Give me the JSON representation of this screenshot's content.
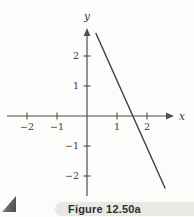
{
  "figure": {
    "caption": "Figure 12.50a"
  },
  "chart_data": {
    "type": "line",
    "title": "",
    "xlabel": "x",
    "ylabel": "y",
    "xlim": [
      -2.7,
      2.9
    ],
    "ylim": [
      -2.7,
      2.9
    ],
    "grid": false,
    "x_ticks": [
      -2,
      -1,
      1,
      2
    ],
    "x_tick_labels": [
      "−2",
      "−1",
      "1",
      "2"
    ],
    "y_ticks": [
      -2,
      -1,
      1,
      2
    ],
    "y_tick_labels": [
      "−2",
      "−1",
      "1",
      "2"
    ],
    "series": [
      {
        "name": "line-segment",
        "points": [
          [
            0.3,
            2.75
          ],
          [
            2.6,
            -2.4
          ]
        ],
        "x_intercept": 1.5,
        "approx_equation": "y = -2x + 3"
      }
    ],
    "legend": null
  },
  "colors": {
    "background": "#fcfcfa",
    "axis": "#4f4f4d",
    "line": "#3f3f3d",
    "text": "#3a3a38",
    "caption_bar": "#e8e8e5",
    "caption_text": "#2e2e2c"
  }
}
